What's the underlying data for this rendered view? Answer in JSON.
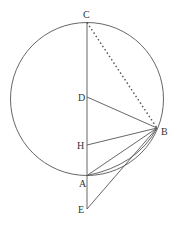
{
  "diagram": {
    "type": "geometry",
    "stroke_color": "#555555",
    "circle": {
      "cx": 87,
      "cy": 99,
      "r": 76.5
    },
    "points": {
      "C": {
        "x": 87,
        "y": 22.5,
        "label": "C",
        "lx": 83,
        "ly": 18
      },
      "D": {
        "x": 87,
        "y": 97,
        "label": "D",
        "lx": 78,
        "ly": 101
      },
      "H": {
        "x": 87,
        "y": 145,
        "label": "H",
        "lx": 77,
        "ly": 149
      },
      "A": {
        "x": 87,
        "y": 175.5,
        "label": "A",
        "lx": 79,
        "ly": 187
      },
      "E": {
        "x": 87,
        "y": 209,
        "label": "E",
        "lx": 78,
        "ly": 213
      },
      "B": {
        "x": 157,
        "y": 128,
        "label": "B",
        "lx": 161,
        "ly": 135
      }
    },
    "segments": [
      {
        "from": "C",
        "to": "E",
        "style": "solid"
      },
      {
        "from": "C",
        "to": "B",
        "style": "dotted"
      },
      {
        "from": "D",
        "to": "B",
        "style": "solid"
      },
      {
        "from": "H",
        "to": "B",
        "style": "solid"
      },
      {
        "from": "A",
        "to": "B",
        "style": "solid"
      },
      {
        "from": "E",
        "to": "B",
        "style": "solid"
      }
    ],
    "arc_AB": {
      "description": "additional line from A to B hugging circle (chord)",
      "style": "solid"
    }
  }
}
